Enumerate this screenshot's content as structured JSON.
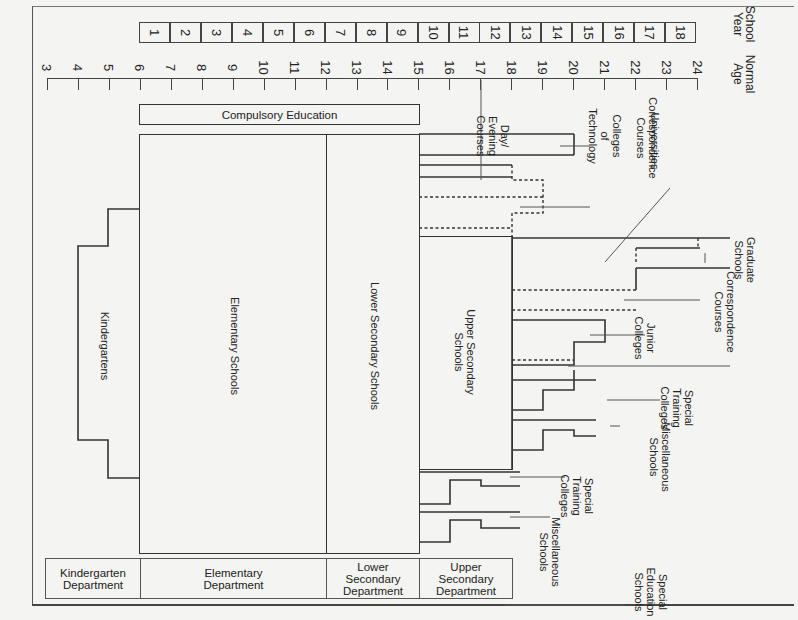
{
  "caption": "System of Japanese education",
  "headers": {
    "school_year": "School\nYear",
    "normal_age": "Normal\nAge"
  },
  "school_years": [
    "1",
    "2",
    "3",
    "4",
    "5",
    "6",
    "7",
    "8",
    "9",
    "10",
    "11",
    "12",
    "13",
    "14",
    "15",
    "16",
    "17",
    "18"
  ],
  "ages": [
    "3",
    "4",
    "5",
    "6",
    "7",
    "8",
    "9",
    "10",
    "11",
    "12",
    "13",
    "14",
    "15",
    "16",
    "17",
    "18",
    "19",
    "20",
    "21",
    "22",
    "23",
    "24"
  ],
  "compulsory": "Compulsory Education",
  "schools": {
    "kindergartens": "Kindergartens",
    "elementary": "Elementary Schools",
    "lower_secondary": "Lower Secondary Schools",
    "upper_secondary": "Upper Secondary\nSchools",
    "day_evening": "Day/\nEvening\nCourses",
    "colleges_tech": "Colleges\nof\nTechnology",
    "correspondence_hs": "Correspondence\nCourses",
    "universities": "Universities",
    "graduate": "Graduate\nSchools",
    "correspondence_univ": "Correspondence\nCourses",
    "junior_colleges": "Junior\nColleges",
    "special_training_1": "Special\nTraining\nColleges",
    "misc_1": "Miscellaneous\nSchools",
    "special_training_2": "Special\nTraining\nColleges",
    "misc_2": "Miscellaneous\nSchools",
    "special_education": "Special\nEducation\nSchools"
  },
  "departments": [
    {
      "label": "Kindergarten\nDepartment"
    },
    {
      "label": "Elementary\nDepartment"
    },
    {
      "label": "Lower\nSecondary\nDepartment"
    },
    {
      "label": "Upper\nSecondary\nDepartment"
    }
  ]
}
